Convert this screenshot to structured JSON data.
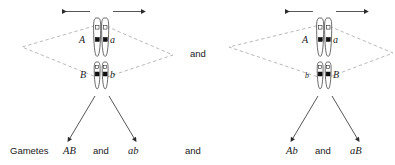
{
  "figure": {
    "title_text": "",
    "gametes_label": "Gametes",
    "conjunction": "and",
    "colors": {
      "ink": "#1a1a1a",
      "chromosome_outline": "#2b2b2b",
      "locus_filled": "#111111",
      "locus_open": "#ffffff",
      "dashed_guide": "#8a8a8a",
      "background": "#ffffff"
    }
  },
  "panels": [
    {
      "id": "left-panel",
      "name": "arrangement-one",
      "upper_pair": {
        "left_allele": "A",
        "right_allele": "a"
      },
      "lower_pair": {
        "left_allele": "B",
        "right_allele": "b"
      },
      "separation_arrows": {
        "left_direction": "left",
        "right_direction": "right"
      },
      "gametes": {
        "first": "AB",
        "conjunction": "and",
        "second": "ab"
      }
    },
    {
      "id": "right-panel",
      "name": "arrangement-two",
      "upper_pair": {
        "left_allele": "A",
        "right_allele": "a"
      },
      "lower_pair": {
        "left_allele": "b",
        "right_allele": "B"
      },
      "separation_arrows": {
        "left_direction": "left",
        "right_direction": "right"
      },
      "gametes": {
        "first": "Ab",
        "conjunction": "and",
        "second": "aB"
      }
    }
  ],
  "connectors": {
    "middle_and": "and",
    "bottom_and": "and"
  }
}
